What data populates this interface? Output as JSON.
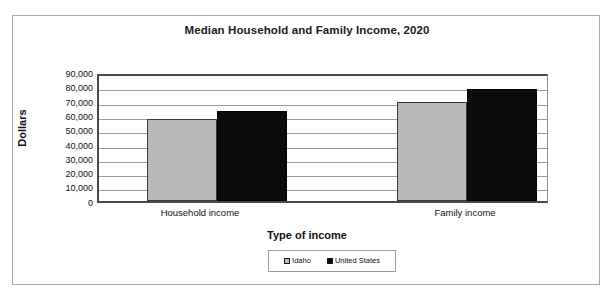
{
  "chart_data": {
    "type": "bar",
    "title": "Median Household and Family Income, 2020",
    "xlabel": "Type of income",
    "ylabel": "Dollars",
    "categories": [
      "Household income",
      "Family income"
    ],
    "series": [
      {
        "name": "Idaho",
        "color": "#b9b9b9",
        "values": [
          59000,
          71500
        ]
      },
      {
        "name": "United States",
        "color": "#0b0b0b",
        "values": [
          65000,
          81000
        ]
      }
    ],
    "ylim": [
      0,
      90000
    ],
    "ytick_values": [
      0,
      10000,
      20000,
      30000,
      40000,
      50000,
      60000,
      70000,
      80000,
      90000
    ],
    "ytick_labels": [
      "0",
      "10,000",
      "20,000",
      "30,000",
      "40,000",
      "50,000",
      "60,000",
      "70,000",
      "80,000",
      "90,000"
    ],
    "grid": true,
    "grid_axis": "y",
    "legend_position": "bottom",
    "legend_entries": [
      "Idaho",
      "United States"
    ]
  },
  "figure": {
    "background_color": "#ffffff",
    "frame_color": "#a8a8a8",
    "axis_color": "#4a4a4a",
    "gridline_color": "#9a9a9a"
  }
}
